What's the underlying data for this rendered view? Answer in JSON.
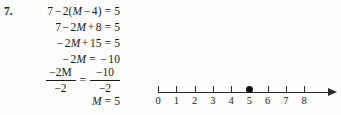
{
  "problem": {
    "number_label": "7.",
    "variable": "M",
    "steps": [
      {
        "id": "step-1",
        "text": "7 − 2(M − 4) = 5",
        "segments": [
          {
            "t": "7",
            "italic": false
          },
          {
            "t": " − ",
            "italic": false
          },
          {
            "t": "2(",
            "italic": false
          },
          {
            "t": "M",
            "italic": true
          },
          {
            "t": " − 4) = 5",
            "italic": false
          }
        ]
      },
      {
        "id": "step-2",
        "text": "7 − 2M + 8 = 5",
        "segments": [
          {
            "t": "7 − 2",
            "italic": false
          },
          {
            "t": "M",
            "italic": true
          },
          {
            "t": " + 8 = 5",
            "italic": false
          }
        ]
      },
      {
        "id": "step-3",
        "text": "−2M + 15 = 5",
        "segments": [
          {
            "t": "− 2",
            "italic": false
          },
          {
            "t": "M",
            "italic": true
          },
          {
            "t": " + 15 = 5",
            "italic": false
          }
        ]
      },
      {
        "id": "step-4",
        "text": "−2M = −10",
        "segments": [
          {
            "t": "− 2",
            "italic": false
          },
          {
            "t": "M",
            "italic": true
          },
          {
            "t": " = − 10",
            "italic": false
          }
        ]
      },
      {
        "id": "step-6",
        "text": "M = 5",
        "segments": [
          {
            "t": "M",
            "italic": true
          },
          {
            "t": " = 5",
            "italic": false
          }
        ]
      }
    ],
    "fraction_step": {
      "id": "step-5",
      "left_numerator": "−2M",
      "left_denominator": "−2",
      "equals": "=",
      "right_numerator": "−10",
      "right_denominator": "−2"
    },
    "solution_value": "5"
  },
  "number_line": {
    "min": 0,
    "max": 8,
    "tick_values": [
      0,
      1,
      2,
      3,
      4,
      5,
      6,
      7,
      8
    ],
    "tick_labels": [
      "0",
      "1",
      "2",
      "3",
      "4",
      "5",
      "6",
      "7",
      "8"
    ],
    "marked_point": 5,
    "marked_point_style": "filled-circle",
    "has_right_arrow": true,
    "axis_color": "#2b2b2b",
    "point_color": "#111111"
  },
  "page": {
    "background_color": "#fefefe",
    "text_color": "#1a1a1a"
  }
}
